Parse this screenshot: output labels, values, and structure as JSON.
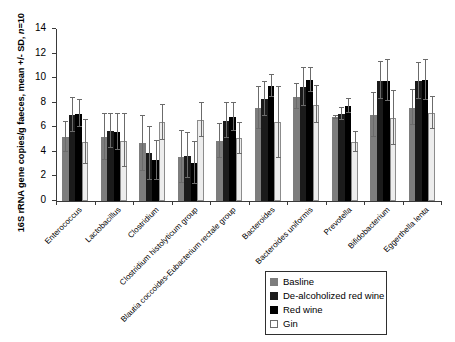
{
  "chart_data": {
    "type": "bar",
    "title": "",
    "xlabel": "",
    "ylabel": "16S rRNA gene copies/g faeces, mean +/- SD, n=10",
    "ylim": [
      0,
      14
    ],
    "yticks": [
      0,
      2,
      4,
      6,
      8,
      10,
      12,
      14
    ],
    "grid": false,
    "legend_position": "bottom-right",
    "categories": [
      "Enterococcus",
      "Lactobacillus",
      "Clostridium",
      "Clostridium histolyticum group",
      "Blautia coccoides-Eubacterium rectale group",
      "Bacteroides",
      "Bacteroides uniformis",
      "Prevotella",
      "Bifidobacterium",
      "Eggerthella lenta"
    ],
    "series": [
      {
        "name": "Basline",
        "color": "#7d7d7d",
        "values": [
          5.2,
          5.2,
          4.7,
          3.6,
          4.9,
          7.55,
          8.5,
          6.8,
          7.0,
          7.6
        ],
        "errors": [
          1.2,
          1.85,
          2.25,
          2.1,
          1.4,
          1.7,
          1.05,
          0.15,
          1.8,
          1.45
        ]
      },
      {
        "name": "De-alcoholized red wine",
        "color": "#1b1b1b",
        "values": [
          7.0,
          5.7,
          3.9,
          3.7,
          6.55,
          8.3,
          9.25,
          7.1,
          9.8,
          9.75
        ],
        "errors": [
          1.35,
          1.4,
          2.15,
          1.85,
          1.45,
          1.4,
          1.55,
          0.5,
          1.5,
          1.45
        ]
      },
      {
        "name": "Red wine",
        "color": "#000000",
        "values": [
          7.1,
          5.6,
          3.3,
          3.1,
          6.85,
          9.35,
          9.85,
          7.75,
          9.8,
          9.85
        ],
        "errors": [
          1.1,
          1.45,
          1.55,
          1.7,
          1.15,
          0.9,
          1.0,
          0.55,
          1.65,
          1.6
        ]
      },
      {
        "name": "Gin",
        "color": "#ededed",
        "values": [
          4.8,
          4.9,
          6.4,
          6.6,
          5.1,
          6.4,
          7.85,
          4.8,
          6.75,
          7.15
        ],
        "errors": [
          1.8,
          2.15,
          1.4,
          1.35,
          1.25,
          2.9,
          1.5,
          0.8,
          2.2,
          1.3
        ]
      }
    ]
  },
  "legend": {
    "items": [
      {
        "label": "Basline"
      },
      {
        "label": "De-alcoholized red wine"
      },
      {
        "label": "Red wine"
      },
      {
        "label": "Gin"
      }
    ]
  },
  "axis": {
    "y_title_main": "16S rRNA gene copies/g faeces, mean +/- SD, ",
    "y_title_italic": "n",
    "y_title_tail": "=10"
  }
}
